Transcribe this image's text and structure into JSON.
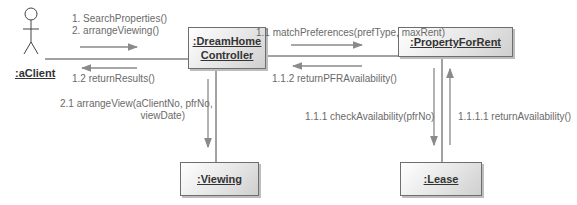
{
  "diagram": {
    "type": "UML communication diagram",
    "actor": {
      "label": ":aClient"
    },
    "objects": [
      {
        "id": "controller",
        "label_line1": ":DreamHome",
        "label_line2": "Controller"
      },
      {
        "id": "property",
        "label": ":PropertyForRent"
      },
      {
        "id": "viewing",
        "label": ":Viewing"
      },
      {
        "id": "lease",
        "label": ":Lease"
      }
    ],
    "messages": {
      "client_to_controller_1": "1. SearchProperties()",
      "client_to_controller_2": "2. arrangeViewing()",
      "controller_to_client": "1.2 returnResults()",
      "controller_to_property": "1.1 matchPreferences(prefType, maxRent)",
      "property_to_controller": "1.1.2 returnPFRAvailability()",
      "controller_to_viewing_line1": "2.1 arrangeView(aClientNo, pfrNo,",
      "controller_to_viewing_line2": "viewDate)",
      "property_to_lease": "1.1.1 checkAvailability(pfrNo)",
      "lease_to_property": "1.1.1.1 returnAvailability()"
    },
    "colors": {
      "line": "#444444",
      "arrow": "#8a8a8a",
      "box_border": "#6e6e6e"
    }
  }
}
